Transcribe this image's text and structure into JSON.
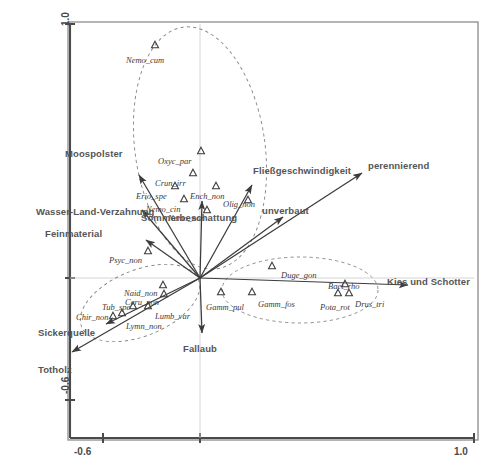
{
  "figure": {
    "kind": "ordination-biplot",
    "frame": {
      "left": 68,
      "top": 22,
      "right": 478,
      "bottom": 440
    },
    "origin_px": {
      "x": 200,
      "y": 278
    },
    "marker_glyph": "triangle-up-outline",
    "colors": {
      "axis": "#4a4a4a",
      "frame": "#7a7a7a",
      "arrow": "#3c3c3c",
      "ellipse": "#8a8a8a",
      "env_text": "#555555",
      "species_text": "#3a3a3a",
      "background": "#ffffff"
    }
  },
  "axes": {
    "x": {
      "min_label": "-0.6",
      "max_label": "1.0"
    },
    "y": {
      "min_label": "-0.6",
      "max_label": "1.0"
    }
  },
  "chart_data": {
    "type": "scatter",
    "title": "",
    "subtitle": "",
    "xlabel": "",
    "ylabel": "",
    "xlim": [
      -0.6,
      1.0
    ],
    "ylim": [
      -0.6,
      1.0
    ],
    "grid": false,
    "legend": "none",
    "species": [
      {
        "code": "Nemo_cum",
        "px": {
          "x": 155,
          "y": 45
        },
        "label_px": {
          "x": 126,
          "y": 55
        },
        "group": "upper"
      },
      {
        "code": "Oxyc_par",
        "px": {
          "x": 201,
          "y": 151
        },
        "label_px": {
          "x": 158,
          "y": 156
        },
        "group": "upper"
      },
      {
        "code": "Crun_irr",
        "px": {
          "x": 193,
          "y": 173
        },
        "label_px": {
          "x": 155,
          "y": 178
        },
        "group": "upper"
      },
      {
        "code": "Erio_spe",
        "px": {
          "x": 175,
          "y": 186
        },
        "label_px": {
          "x": 136,
          "y": 191
        },
        "group": "upper"
      },
      {
        "code": "Ench_non",
        "px": {
          "x": 216,
          "y": 186
        },
        "label_px": {
          "x": 190,
          "y": 191
        },
        "group": "upper"
      },
      {
        "code": "Nemo_cin",
        "px": {
          "x": 184,
          "y": 199
        },
        "label_px": {
          "x": 146,
          "y": 204
        },
        "group": "upper"
      },
      {
        "code": "Olig_non",
        "px": {
          "x": 248,
          "y": 200
        },
        "label_px": {
          "x": 223,
          "y": 199
        },
        "group": "upper"
      },
      {
        "code": "Nemo_non",
        "px": {
          "x": 207,
          "y": 210
        },
        "label_px": {
          "x": 168,
          "y": 213
        },
        "group": "upper"
      },
      {
        "code": "Psyc_non",
        "px": {
          "x": 148,
          "y": 251
        },
        "label_px": {
          "x": 109,
          "y": 255
        },
        "group": "none"
      },
      {
        "code": "Naid_non",
        "px": {
          "x": 163,
          "y": 285
        },
        "label_px": {
          "x": 124,
          "y": 288
        },
        "group": "lower-left"
      },
      {
        "code": "Ceru_non",
        "px": {
          "x": 164,
          "y": 294
        },
        "label_px": {
          "x": 125,
          "y": 297
        },
        "group": "lower-left"
      },
      {
        "code": "Tub_spe",
        "px": {
          "x": 133,
          "y": 306
        },
        "label_px": {
          "x": 102,
          "y": 302
        },
        "group": "lower-left"
      },
      {
        "code": "Lumb_var",
        "px": {
          "x": 148,
          "y": 306
        },
        "label_px": {
          "x": 155,
          "y": 311
        },
        "group": "lower-left"
      },
      {
        "code": "Lymn_non",
        "px": {
          "x": 122,
          "y": 313
        },
        "label_px": {
          "x": 126,
          "y": 321
        },
        "group": "lower-left"
      },
      {
        "code": "Chir_non",
        "px": {
          "x": 113,
          "y": 316
        },
        "label_px": {
          "x": 76,
          "y": 312
        },
        "group": "lower-left"
      },
      {
        "code": "Duge_gon",
        "px": {
          "x": 272,
          "y": 266
        },
        "label_px": {
          "x": 281,
          "y": 270
        },
        "group": "right"
      },
      {
        "code": "Baet_rho",
        "px": {
          "x": 345,
          "y": 284
        },
        "label_px": {
          "x": 328,
          "y": 281
        },
        "group": "right"
      },
      {
        "code": "Gamm_pul",
        "px": {
          "x": 221,
          "y": 292
        },
        "label_px": {
          "x": 206,
          "y": 302
        },
        "group": "right"
      },
      {
        "code": "Gamm_fos",
        "px": {
          "x": 252,
          "y": 292
        },
        "label_px": {
          "x": 258,
          "y": 299
        },
        "group": "right"
      },
      {
        "code": "Pota_rot",
        "px": {
          "x": 338,
          "y": 293
        },
        "label_px": {
          "x": 320,
          "y": 302
        },
        "group": "right"
      },
      {
        "code": "Drus_tri",
        "px": {
          "x": 349,
          "y": 293
        },
        "label_px": {
          "x": 355,
          "y": 299
        },
        "group": "right"
      }
    ],
    "env_vectors": [
      {
        "name": "Moospolster",
        "tip_px": {
          "x": 139,
          "y": 175
        },
        "label_px": {
          "x": 65,
          "y": 148
        }
      },
      {
        "name": "Wasser-Land-Verzahnung",
        "tip_px": {
          "x": 142,
          "y": 210
        },
        "label_px": {
          "x": 36,
          "y": 206
        }
      },
      {
        "name": "Feinmaterial",
        "tip_px": {
          "x": 146,
          "y": 240
        },
        "label_px": {
          "x": 45,
          "y": 228
        }
      },
      {
        "name": "Sommerbeschattung",
        "tip_px": {
          "x": 202,
          "y": 201
        },
        "label_px": {
          "x": 141,
          "y": 212
        }
      },
      {
        "name": "Fließgeschwindigkeit",
        "tip_px": {
          "x": 252,
          "y": 185
        },
        "label_px": {
          "x": 253,
          "y": 165
        }
      },
      {
        "name": "unverbaut",
        "tip_px": {
          "x": 283,
          "y": 217
        },
        "label_px": {
          "x": 262,
          "y": 205
        }
      },
      {
        "name": "perennierend",
        "tip_px": {
          "x": 362,
          "y": 173
        },
        "label_px": {
          "x": 368,
          "y": 160
        }
      },
      {
        "name": "Kies und Schotter",
        "tip_px": {
          "x": 408,
          "y": 285
        },
        "label_px": {
          "x": 387,
          "y": 276
        }
      },
      {
        "name": "Fallaub",
        "tip_px": {
          "x": 202,
          "y": 333
        },
        "label_px": {
          "x": 183,
          "y": 343
        }
      },
      {
        "name": "Sickerquelle",
        "tip_px": {
          "x": 106,
          "y": 324
        },
        "label_px": {
          "x": 38,
          "y": 327
        }
      },
      {
        "name": "Totholz",
        "tip_px": {
          "x": 72,
          "y": 352
        },
        "label_px": {
          "x": 38,
          "y": 364
        }
      }
    ],
    "ellipses": [
      {
        "group": "upper",
        "cx": 200,
        "cy": 148,
        "rx": 65,
        "ry": 122,
        "rotation_deg": -8
      },
      {
        "group": "lower-left",
        "cx": 140,
        "cy": 303,
        "rx": 63,
        "ry": 33,
        "rotation_deg": -22
      },
      {
        "group": "right",
        "cx": 300,
        "cy": 290,
        "rx": 78,
        "ry": 33,
        "rotation_deg": 0
      }
    ]
  }
}
